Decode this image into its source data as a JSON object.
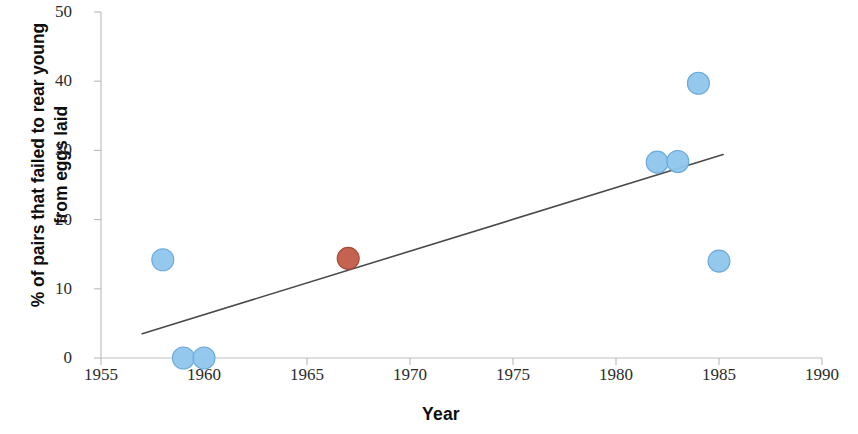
{
  "chart_data": {
    "type": "scatter",
    "title": "",
    "xlabel": "Year",
    "ylabel": "% of  pairs that failed to rear young from eggs laid",
    "ylabel_lines": [
      "% of  pairs that failed to rear young",
      "from eggs laid"
    ],
    "xlim": [
      1955,
      1990
    ],
    "ylim": [
      0,
      50
    ],
    "xticks": [
      1955,
      1960,
      1965,
      1970,
      1975,
      1980,
      1985,
      1990
    ],
    "xtick_labels": [
      "1955",
      "1960",
      "1965",
      "1970",
      "1975",
      "1980",
      "1985",
      "1990"
    ],
    "yticks": [
      0,
      10,
      20,
      30,
      40,
      50
    ],
    "ytick_labels": [
      "0",
      "10",
      "20",
      "30",
      "40",
      "50"
    ],
    "grid": false,
    "legend": null,
    "series": [
      {
        "name": "observations",
        "marker": "circle",
        "color": "#8fc5ec",
        "edge_color": "#6aa9dc",
        "points": [
          {
            "x": 1958,
            "y": 14.2
          },
          {
            "x": 1959,
            "y": 0.0
          },
          {
            "x": 1960,
            "y": 0.0
          },
          {
            "x": 1982,
            "y": 28.3
          },
          {
            "x": 1983,
            "y": 28.4
          },
          {
            "x": 1984,
            "y": 39.7
          },
          {
            "x": 1985,
            "y": 14.0
          }
        ]
      },
      {
        "name": "highlighted observation",
        "marker": "circle",
        "color": "#c15b47",
        "edge_color": "#a94a38",
        "points": [
          {
            "x": 1967,
            "y": 14.4
          }
        ]
      }
    ],
    "trendline": {
      "type": "linear",
      "color": "#4a4a4a",
      "x_start": 1957.0,
      "y_start": 3.5,
      "x_end": 1985.2,
      "y_end": 29.4
    },
    "axis_color": "#bfbfbf"
  }
}
